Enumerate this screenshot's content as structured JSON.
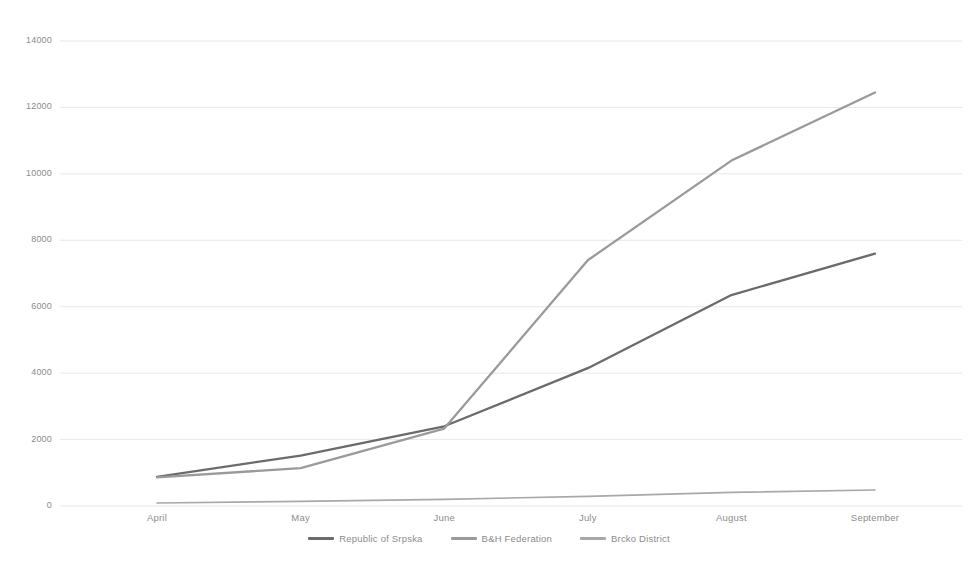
{
  "chart_data": {
    "type": "line",
    "title": "",
    "subtitle": "",
    "xlabel": "",
    "ylabel": "",
    "categories": [
      "April",
      "May",
      "June",
      "July",
      "August",
      "September"
    ],
    "ylim": [
      0,
      14000
    ],
    "ytick_values": [
      0,
      2000,
      4000,
      6000,
      8000,
      10000,
      12000,
      14000
    ],
    "ytick_labels": [
      "0",
      "2000",
      "4000",
      "6000",
      "8000",
      "10000",
      "12000",
      "14000"
    ],
    "grid": true,
    "legend_position": "bottom",
    "series": [
      {
        "name": "Republic of Srpska",
        "color": "#6b6b6b",
        "values": [
          880,
          1520,
          2400,
          4150,
          6350,
          7600
        ]
      },
      {
        "name": "B&H Federation",
        "color": "#9a9a9a",
        "values": [
          860,
          1140,
          2330,
          7400,
          10400,
          12450
        ]
      },
      {
        "name": "Brcko District",
        "color": "#a8a8a8",
        "values": [
          90,
          140,
          200,
          290,
          410,
          480
        ]
      }
    ]
  },
  "axis": {
    "y_tick_labels": [
      "14000",
      "12000",
      "10000",
      "8000",
      "6000",
      "4000",
      "2000",
      "0"
    ],
    "x_tick_labels": [
      "April",
      "May",
      "June",
      "July",
      "August",
      "September"
    ]
  },
  "legend": {
    "items": [
      {
        "label": "Republic of Srpska",
        "color": "#6b6b6b"
      },
      {
        "label": "B&H Federation",
        "color": "#9a9a9a"
      },
      {
        "label": "Brcko District",
        "color": "#a8a8a8"
      }
    ]
  },
  "colors": {
    "background": "#ffffff",
    "gridline": "#e4e4e4",
    "tick_text": "#8c8c8c"
  }
}
